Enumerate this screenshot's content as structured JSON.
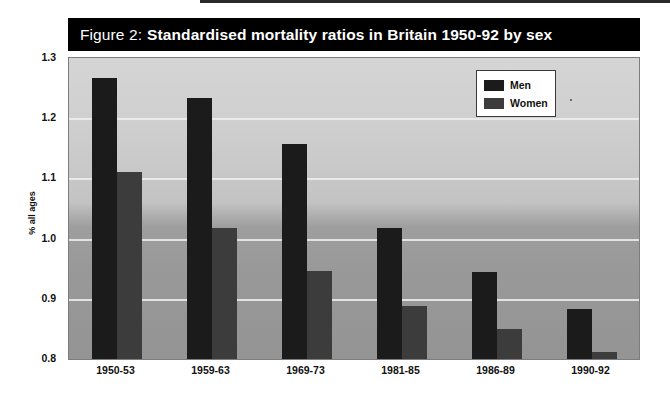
{
  "figure": {
    "label": "Figure 2:",
    "title": "Standardised mortality ratios in Britain 1950-92 by sex"
  },
  "legend": {
    "position": "top-right-inside",
    "entries": [
      {
        "label": "Men",
        "color": "#1b1b1b"
      },
      {
        "label": "Women",
        "color": "#3c3c3c"
      }
    ]
  },
  "axes": {
    "y_title": "% all ages",
    "y_ticks": [
      "1.3",
      "1.2",
      "1.1",
      "1.0",
      "0.9",
      "0.8"
    ]
  },
  "chart_data": {
    "type": "bar",
    "title": "Figure 2: Standardised mortality ratios in Britain 1950-92 by sex",
    "xlabel": "",
    "ylabel": "% all ages",
    "ylim": [
      0.8,
      1.3
    ],
    "yticks": [
      0.8,
      0.9,
      1.0,
      1.1,
      1.2,
      1.3
    ],
    "grid": true,
    "legend_position": "upper right",
    "categories": [
      "1950-53",
      "1959-63",
      "1969-73",
      "1981-85",
      "1986-89",
      "1990-92"
    ],
    "series": [
      {
        "name": "Men",
        "color": "#1b1b1b",
        "values": [
          1.267,
          1.233,
          1.157,
          1.018,
          0.944,
          0.883
        ]
      },
      {
        "name": "Women",
        "color": "#3c3c3c",
        "values": [
          1.11,
          1.018,
          0.946,
          0.888,
          0.85,
          0.812
        ]
      }
    ]
  }
}
